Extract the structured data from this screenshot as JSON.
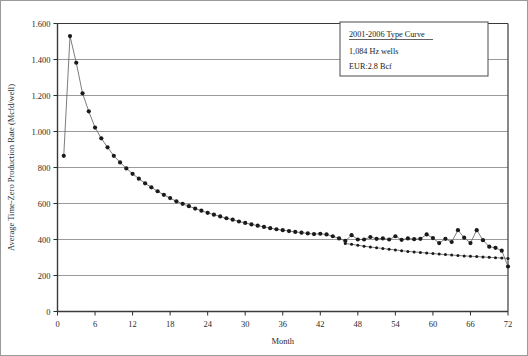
{
  "chart_data": {
    "type": "line",
    "title": "",
    "xlabel": "Month",
    "ylabel": "Average Time-Zero Production Rate (Mcfd/well)",
    "xlim": [
      0,
      72
    ],
    "ylim": [
      0,
      1600
    ],
    "xticks": [
      0,
      6,
      12,
      18,
      24,
      30,
      36,
      42,
      48,
      54,
      60,
      66,
      72
    ],
    "xtick_labels": [
      "0",
      "6",
      "12",
      "18",
      "24",
      "30",
      "36",
      "42",
      "48",
      "54",
      "60",
      "66",
      "72"
    ],
    "yticks": [
      0,
      200,
      400,
      600,
      800,
      1000,
      1200,
      1400,
      1600
    ],
    "ytick_labels": [
      "0",
      "200",
      "400",
      "600",
      "800",
      "1.000",
      "1.200",
      "1.400",
      "1.600"
    ],
    "grid": "horizontal",
    "legend_position": "top-right",
    "marker": "filled-circle",
    "series": [
      {
        "name": "Actual average production",
        "x": [
          1,
          2,
          3,
          4,
          5,
          6,
          7,
          8,
          9,
          10,
          11,
          12,
          13,
          14,
          15,
          16,
          17,
          18,
          19,
          20,
          21,
          22,
          23,
          24,
          25,
          26,
          27,
          28,
          29,
          30,
          31,
          32,
          33,
          34,
          35,
          36,
          37,
          38,
          39,
          40,
          41,
          42,
          43,
          44,
          45,
          46,
          47,
          48,
          49,
          50,
          51,
          52,
          53,
          54,
          55,
          56,
          57,
          58,
          59,
          60,
          61,
          62,
          63,
          64,
          65,
          66,
          67,
          68,
          69,
          70,
          71,
          72
        ],
        "y": [
          865,
          1530,
          1382,
          1212,
          1112,
          1022,
          962,
          912,
          865,
          828,
          795,
          765,
          738,
          712,
          690,
          668,
          648,
          630,
          612,
          598,
          585,
          572,
          560,
          548,
          538,
          528,
          518,
          510,
          500,
          492,
          484,
          477,
          470,
          463,
          457,
          452,
          447,
          442,
          438,
          434,
          430,
          432,
          428,
          418,
          406,
          392,
          424,
          400,
          400,
          414,
          404,
          406,
          400,
          418,
          398,
          406,
          402,
          404,
          428,
          408,
          380,
          404,
          386,
          452,
          410,
          380,
          452,
          396,
          360,
          354,
          338,
          250
        ]
      },
      {
        "name": "Type curve fit",
        "x": [
          46,
          47,
          48,
          49,
          50,
          51,
          52,
          53,
          54,
          55,
          56,
          57,
          58,
          59,
          60,
          61,
          62,
          63,
          64,
          65,
          66,
          67,
          68,
          69,
          70,
          71,
          72
        ],
        "y": [
          378,
          373,
          368,
          363,
          358,
          354,
          350,
          346,
          342,
          338,
          334,
          331,
          328,
          325,
          322,
          319,
          316,
          314,
          311,
          309,
          307,
          305,
          303,
          301,
          299,
          297,
          295
        ]
      }
    ]
  },
  "legend": {
    "title": "2001-2006 Type Curve",
    "lines": [
      "1,084 Hz wells",
      "EUR:2.8 Bcf"
    ]
  },
  "colors": {
    "axis": "#2b2b2b",
    "grid": "#8f8f8f",
    "marker": "#1a1a1a",
    "line": "#5c5c5c",
    "frame": "#3a3a3a",
    "legend_border": "#4a4a4a"
  }
}
